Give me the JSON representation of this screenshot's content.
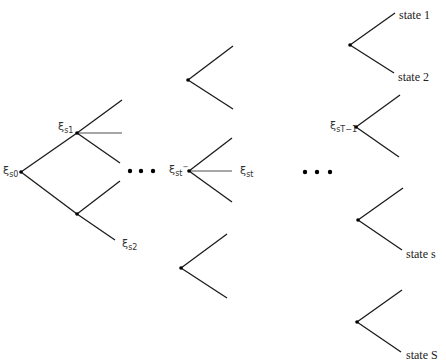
{
  "diagram": {
    "type": "scenario-tree",
    "colors": {
      "line": "#1a1a1a",
      "node": "#000000",
      "label": "#333333",
      "background": "#ffffff"
    },
    "nodes": [
      {
        "id": "s0",
        "x": 21,
        "y": 172,
        "label": {
          "symbol": "ξ",
          "sub": "s0",
          "sup": ""
        }
      },
      {
        "id": "s1",
        "x": 77,
        "y": 133,
        "label": {
          "symbol": "ξ",
          "sub": "s1",
          "sup": ""
        }
      },
      {
        "id": "s2",
        "x": 77,
        "y": 214,
        "label": {
          "symbol": "ξ",
          "sub": "s2",
          "sup": ""
        }
      },
      {
        "id": "mid-top",
        "x": 188,
        "y": 80
      },
      {
        "id": "st-minus",
        "x": 189,
        "y": 171,
        "label": {
          "symbol": "ξ",
          "sub": "st",
          "sup": "−"
        }
      },
      {
        "id": "mid-bottom",
        "x": 181,
        "y": 268
      },
      {
        "id": "right-1",
        "x": 350,
        "y": 45
      },
      {
        "id": "sT-1",
        "x": 356,
        "y": 127,
        "label": {
          "symbol": "ξ",
          "sub": "sT−1",
          "sup": ""
        }
      },
      {
        "id": "right-3",
        "x": 358,
        "y": 220
      },
      {
        "id": "right-4",
        "x": 357,
        "y": 322
      }
    ],
    "labels": {
      "xi_s0": {
        "symbol": "ξ",
        "sub": "s0"
      },
      "xi_s1": {
        "symbol": "ξ",
        "sub": "s1"
      },
      "xi_s2": {
        "symbol": "ξ",
        "sub": "s2"
      },
      "xi_st_minus": {
        "symbol": "ξ",
        "sub": "st",
        "sup": "−"
      },
      "xi_st": {
        "symbol": "ξ",
        "sub": "st"
      },
      "xi_sT_minus_1": {
        "symbol": "ξ",
        "sub": "sT−1"
      }
    },
    "state_labels": {
      "state_1": "state 1",
      "state_2": "state 2",
      "state_s": "state s",
      "state_S": "state S"
    },
    "ellipses": [
      {
        "id": "ellipsis-1",
        "y": 171,
        "xs": [
          130,
          141,
          153
        ]
      },
      {
        "id": "ellipsis-2",
        "y": 172,
        "xs": [
          305,
          317,
          330
        ]
      }
    ]
  }
}
